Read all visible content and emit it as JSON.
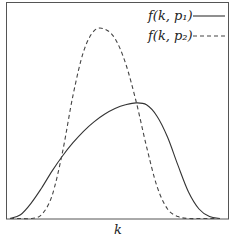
{
  "chart_data": {
    "type": "line",
    "title": "",
    "xlabel": "k",
    "ylabel": "",
    "grid": false,
    "legend_position": "upper right",
    "x": [
      0.0,
      0.05,
      0.1,
      0.15,
      0.2,
      0.25,
      0.3,
      0.35,
      0.4,
      0.45,
      0.5,
      0.55,
      0.6,
      0.65,
      0.7,
      0.75,
      0.8,
      0.85,
      0.9,
      0.95,
      1.0
    ],
    "series": [
      {
        "name": "f(k, p1)",
        "style": "solid",
        "values": [
          0.0,
          0.02,
          0.08,
          0.16,
          0.25,
          0.33,
          0.4,
          0.46,
          0.51,
          0.55,
          0.58,
          0.6,
          0.61,
          0.6,
          0.54,
          0.43,
          0.28,
          0.14,
          0.05,
          0.01,
          0.0
        ]
      },
      {
        "name": "f(k, p2)",
        "style": "dashed",
        "values": [
          0.0,
          0.0,
          0.0,
          0.02,
          0.12,
          0.35,
          0.65,
          0.88,
          0.99,
          1.0,
          0.95,
          0.82,
          0.62,
          0.38,
          0.17,
          0.05,
          0.01,
          0.0,
          0.0,
          0.0,
          0.0
        ]
      }
    ],
    "xlim": [
      0,
      1
    ],
    "ylim": [
      0,
      1.05
    ]
  },
  "legend": {
    "items": [
      {
        "label": "f(k, p₁)",
        "style": "solid"
      },
      {
        "label": "f(k, p₂)",
        "style": "dashed"
      }
    ]
  },
  "axes": {
    "xlabel": "k"
  }
}
